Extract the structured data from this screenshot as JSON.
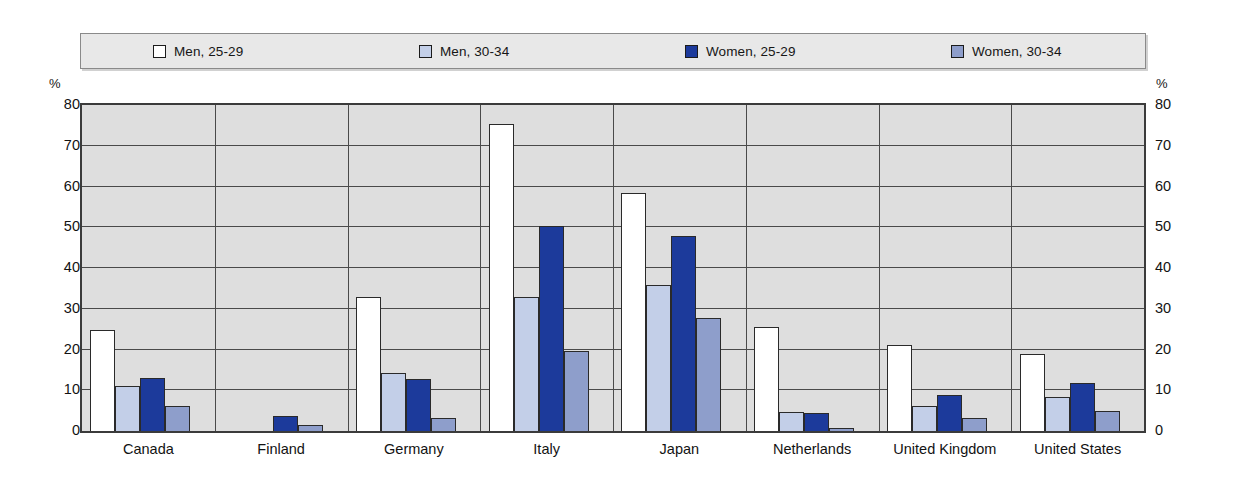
{
  "axis": {
    "unit_left": "%",
    "unit_right": "%",
    "ticks": [
      0,
      10,
      20,
      30,
      40,
      50,
      60,
      70,
      80
    ],
    "ymin": 0,
    "ymax": 80
  },
  "legend": {
    "items": [
      {
        "label": "Men, 25-29",
        "color": "#ffffff",
        "swatch_name": "legend-swatch-men-25-29"
      },
      {
        "label": "Men, 30-34",
        "color": "#c3cfe8",
        "swatch_name": "legend-swatch-men-30-34"
      },
      {
        "label": "Women, 25-29",
        "color": "#1c3a9b",
        "swatch_name": "legend-swatch-women-25-29"
      },
      {
        "label": "Women, 30-34",
        "color": "#8e9ecb",
        "swatch_name": "legend-swatch-women-30-34"
      }
    ]
  },
  "chart_data": {
    "type": "bar",
    "title": "",
    "xlabel": "",
    "ylabel": "%",
    "ylim": [
      0,
      80
    ],
    "yticks": [
      0,
      10,
      20,
      30,
      40,
      50,
      60,
      70,
      80
    ],
    "grid": true,
    "legend_position": "top",
    "categories": [
      "Canada",
      "Finland",
      "Germany",
      "Italy",
      "Japan",
      "Netherlands",
      "United Kingdom",
      "United States"
    ],
    "series": [
      {
        "name": "Men, 25-29",
        "color": "#ffffff",
        "values": [
          24.8,
          0,
          33.0,
          75.3,
          58.5,
          25.6,
          21.2,
          18.8
        ]
      },
      {
        "name": "Men, 30-34",
        "color": "#c3cfe8",
        "values": [
          11.1,
          0,
          14.3,
          32.8,
          35.8,
          4.7,
          6.2,
          8.3
        ]
      },
      {
        "name": "Women, 25-29",
        "color": "#1c3a9b",
        "values": [
          13.0,
          3.8,
          12.8,
          50.2,
          47.8,
          4.5,
          8.8,
          11.8
        ]
      },
      {
        "name": "Women, 30-34",
        "color": "#8e9ecb",
        "values": [
          6.2,
          1.4,
          3.2,
          19.7,
          27.7,
          0.8,
          3.3,
          4.9
        ]
      }
    ]
  }
}
